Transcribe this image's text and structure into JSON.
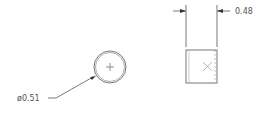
{
  "drawing": {
    "front_view": {
      "name": "circular end view",
      "diameter_label": "ø0.51"
    },
    "side_view": {
      "name": "rectangular side view",
      "width_label": "0.48"
    },
    "colors": {
      "line": "#555555",
      "background": "#ffffff"
    }
  }
}
